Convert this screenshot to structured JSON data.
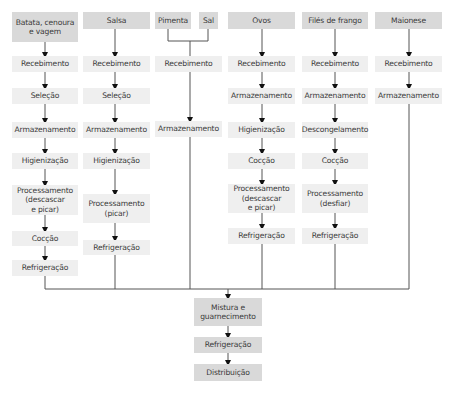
{
  "diagram": {
    "type": "flowchart",
    "colors": {
      "header_fill": "#d9d9d9",
      "step_fill": "#efefef",
      "final_fill": "#d9d9d9",
      "line": "#555555"
    },
    "columns": [
      {
        "header": "Batata, cenoura e vagem",
        "header_lines": [
          "Batata, cenoura",
          "e vagem"
        ],
        "steps": [
          "Recebimento",
          "Seleção",
          "Armazenamento",
          "Higienização",
          "Processamento (descascar e picar)",
          "Cocção",
          "Refrigeração"
        ]
      },
      {
        "header": "Salsa",
        "steps": [
          "Recebimento",
          "Seleção",
          "Armazenamento",
          "Higienização",
          "Processamento (picar)",
          "Refrigeração"
        ]
      },
      {
        "header": "Pimenta + Sal",
        "headers": [
          "Pimenta",
          "Sal"
        ],
        "steps": [
          "Recebimento",
          "Armazenamento"
        ]
      },
      {
        "header": "Ovos",
        "steps": [
          "Recebimento",
          "Armazenamento",
          "Higienização",
          "Cocção",
          "Processamento (descascar e picar)",
          "Refrigeração"
        ]
      },
      {
        "header": "Filés de frango",
        "steps": [
          "Recebimento",
          "Armazenamento",
          "Descongelamento",
          "Cocção",
          "Processamento (desfiar)",
          "Refrigeração"
        ]
      },
      {
        "header": "Maionese",
        "steps": [
          "Recebimento",
          "Armazenamento"
        ]
      }
    ],
    "final_steps": [
      "Mistura e guarnecimento",
      "Refrigeração",
      "Distribuição"
    ]
  },
  "labels": {
    "c1_head_1": "Batata, cenoura",
    "c1_head_2": "e vagem",
    "c2_head": "Salsa",
    "c3_head_a": "Pimenta",
    "c3_head_b": "Sal",
    "c4_head": "Ovos",
    "c5_head": "Filés de frango",
    "c6_head": "Maionese",
    "recebimento": "Recebimento",
    "selecao": "Seleção",
    "armazenamento": "Armazenamento",
    "higienizacao": "Higienização",
    "processamento": "Processamento",
    "descascar": "(descascar",
    "e_picar": "e picar)",
    "picar": "(picar)",
    "desfiar": "(desfiar)",
    "coccao": "Cocção",
    "refrigeracao": "Refrigeração",
    "descongelamento": "Descongelamento",
    "mistura_1": "Mistura e",
    "mistura_2": "guarnecimento",
    "distribuicao": "Distribuição"
  }
}
